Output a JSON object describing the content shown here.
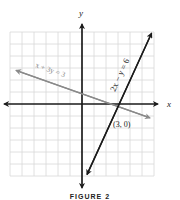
{
  "figure": {
    "caption": "FIGURE 2",
    "axes": {
      "x_label": "x",
      "y_label": "y"
    },
    "grid": {
      "x_range": [
        -6,
        6
      ],
      "y_range": [
        -6,
        6
      ],
      "step": 1
    },
    "lines": [
      {
        "equation": "2x − y = 6",
        "color": "#1a1a1a",
        "from": [
          0.5,
          -5.7
        ],
        "to": [
          5.8,
          5.9
        ]
      },
      {
        "equation": "x + 3y = 3",
        "color": "#8a8a8a",
        "from": [
          -5.5,
          2.8
        ],
        "to": [
          5.5,
          -1.1
        ]
      }
    ],
    "point_label": "(3, 0)"
  },
  "colors": {
    "grid": "#d8d8d8",
    "axis": "#1a1a1a",
    "line_primary": "#1a1a1a",
    "line_secondary": "#8a8a8a"
  }
}
